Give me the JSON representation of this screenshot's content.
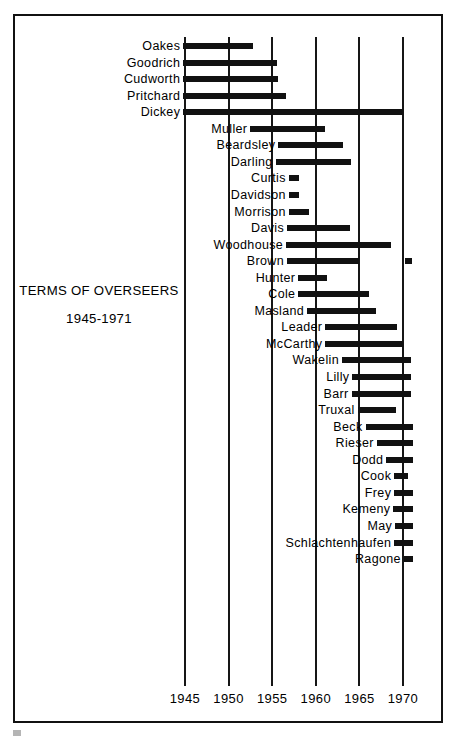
{
  "caption": {
    "title": "TERMS OF OVERSEERS",
    "subtitle": "1945-1971"
  },
  "chart_data": {
    "type": "bar",
    "orientation": "horizontal",
    "title": "TERMS OF OVERSEERS",
    "subtitle": "1945-1971",
    "xlabel": "",
    "ylabel": "",
    "xlim": [
      1942.5,
      1971.5
    ],
    "grid": true,
    "grid_axis": "x",
    "legend": "none",
    "xticks": [
      1945,
      1950,
      1955,
      1960,
      1965,
      1970
    ],
    "xtick_labels": [
      "1945",
      "1950",
      "1955",
      "1960",
      "1965",
      "1970"
    ],
    "categories": [
      "Oakes",
      "Goodrich",
      "Cudworth",
      "Pritchard",
      "Dickey",
      "Muller",
      "Beardsley",
      "Darling",
      "Curtis",
      "Davidson",
      "Morrison",
      "Davis",
      "Woodhouse",
      "Brown",
      "Hunter",
      "Cole",
      "Masland",
      "Leader",
      "McCarthy",
      "Wakelin",
      "Lilly",
      "Barr",
      "Truxal",
      "Beck",
      "Rieser",
      "Dodd",
      "Cook",
      "Frey",
      "Kemeny",
      "May",
      "Schlachtenhaufen",
      "Ragone"
    ],
    "bars": [
      {
        "label": "Oakes",
        "start": 1944.8,
        "end": 1952.8
      },
      {
        "label": "Goodrich",
        "start": 1944.8,
        "end": 1955.6
      },
      {
        "label": "Cudworth",
        "start": 1944.8,
        "end": 1955.7
      },
      {
        "label": "Pritchard",
        "start": 1944.8,
        "end": 1956.6
      },
      {
        "label": "Dickey",
        "start": 1944.8,
        "end": 1970.0
      },
      {
        "label": "Muller",
        "start": 1952.5,
        "end": 1961.1
      },
      {
        "label": "Beardsley",
        "start": 1955.7,
        "end": 1963.1
      },
      {
        "label": "Darling",
        "start": 1955.4,
        "end": 1964.0
      },
      {
        "label": "Curtis",
        "start": 1956.9,
        "end": 1958.1
      },
      {
        "label": "Davidson",
        "start": 1956.9,
        "end": 1958.1
      },
      {
        "label": "Morrison",
        "start": 1956.9,
        "end": 1959.2
      },
      {
        "label": "Davis",
        "start": 1956.7,
        "end": 1963.9
      },
      {
        "label": "Woodhouse",
        "start": 1956.6,
        "end": 1968.6
      },
      {
        "label": "Brown",
        "start": 1956.7,
        "end": 1964.9
      },
      {
        "label": "Brown-second",
        "start": 1970.2,
        "end": 1971.0,
        "of": "Brown"
      },
      {
        "label": "Hunter",
        "start": 1958.0,
        "end": 1961.3
      },
      {
        "label": "Cole",
        "start": 1958.0,
        "end": 1966.1
      },
      {
        "label": "Masland",
        "start": 1959.0,
        "end": 1966.9
      },
      {
        "label": "Leader",
        "start": 1961.1,
        "end": 1969.3
      },
      {
        "label": "McCarthy",
        "start": 1961.1,
        "end": 1970.0
      },
      {
        "label": "Wakelin",
        "start": 1963.0,
        "end": 1970.9
      },
      {
        "label": "Lilly",
        "start": 1964.2,
        "end": 1970.9
      },
      {
        "label": "Barr",
        "start": 1964.1,
        "end": 1970.9
      },
      {
        "label": "Truxal",
        "start": 1964.8,
        "end": 1969.2
      },
      {
        "label": "Beck",
        "start": 1965.7,
        "end": 1971.2
      },
      {
        "label": "Rieser",
        "start": 1967.0,
        "end": 1971.2
      },
      {
        "label": "Dodd",
        "start": 1968.1,
        "end": 1971.2
      },
      {
        "label": "Cook",
        "start": 1969.0,
        "end": 1970.6
      },
      {
        "label": "Frey",
        "start": 1969.0,
        "end": 1971.2
      },
      {
        "label": "Kemeny",
        "start": 1968.9,
        "end": 1971.2
      },
      {
        "label": "May",
        "start": 1969.1,
        "end": 1971.2
      },
      {
        "label": "Schlachtenhaufen",
        "start": 1969.0,
        "end": 1971.2
      },
      {
        "label": "Ragone",
        "start": 1970.1,
        "end": 1971.2
      }
    ]
  },
  "colors": {
    "bar": "#111111",
    "grid": "#161616",
    "frame": "#111111",
    "text": "#000000",
    "background": "#ffffff"
  }
}
